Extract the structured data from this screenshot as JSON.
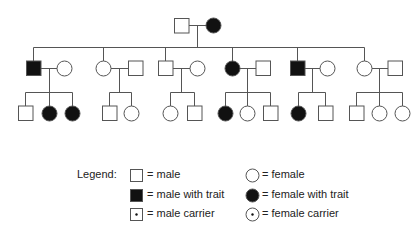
{
  "diagram": {
    "type": "pedigree-chart",
    "colors": {
      "line": "#555555",
      "fill": "#111111",
      "background": "#ffffff"
    },
    "generation_1": [
      {
        "id": "g1-father",
        "sex": "male",
        "status": "unaffected"
      },
      {
        "id": "g1-mother",
        "sex": "female",
        "status": "affected"
      }
    ],
    "generation_2_families": [
      {
        "child": {
          "sex": "male",
          "status": "affected"
        },
        "spouse": {
          "sex": "female",
          "status": "unaffected"
        },
        "children": [
          {
            "sex": "male",
            "status": "unaffected"
          },
          {
            "sex": "female",
            "status": "affected"
          },
          {
            "sex": "female",
            "status": "affected"
          }
        ]
      },
      {
        "child": {
          "sex": "female",
          "status": "unaffected"
        },
        "spouse": {
          "sex": "male",
          "status": "unaffected"
        },
        "children": [
          {
            "sex": "male",
            "status": "unaffected"
          },
          {
            "sex": "female",
            "status": "unaffected"
          }
        ]
      },
      {
        "child": {
          "sex": "male",
          "status": "unaffected"
        },
        "spouse": {
          "sex": "female",
          "status": "unaffected"
        },
        "children": [
          {
            "sex": "female",
            "status": "unaffected"
          },
          {
            "sex": "male",
            "status": "unaffected"
          }
        ]
      },
      {
        "child": {
          "sex": "female",
          "status": "affected"
        },
        "spouse": {
          "sex": "male",
          "status": "unaffected"
        },
        "children": [
          {
            "sex": "female",
            "status": "affected"
          },
          {
            "sex": "female",
            "status": "unaffected"
          },
          {
            "sex": "male",
            "status": "unaffected"
          }
        ]
      },
      {
        "child": {
          "sex": "male",
          "status": "affected"
        },
        "spouse": {
          "sex": "female",
          "status": "unaffected"
        },
        "children": [
          {
            "sex": "female",
            "status": "affected"
          },
          {
            "sex": "male",
            "status": "unaffected"
          }
        ]
      },
      {
        "child": {
          "sex": "female",
          "status": "unaffected"
        },
        "spouse": {
          "sex": "male",
          "status": "unaffected"
        },
        "children": [
          {
            "sex": "male",
            "status": "unaffected"
          },
          {
            "sex": "female",
            "status": "unaffected"
          },
          {
            "sex": "female",
            "status": "unaffected"
          }
        ]
      }
    ]
  },
  "legend": {
    "title": "Legend:",
    "items": [
      {
        "symbol": "square-empty",
        "label": "= male"
      },
      {
        "symbol": "square-filled",
        "label": "= male with trait"
      },
      {
        "symbol": "square-dot",
        "label": "= male carrier"
      },
      {
        "symbol": "circle-empty",
        "label": "= female"
      },
      {
        "symbol": "circle-filled",
        "label": "= female with trait"
      },
      {
        "symbol": "circle-dot",
        "label": "= female carrier"
      }
    ]
  }
}
